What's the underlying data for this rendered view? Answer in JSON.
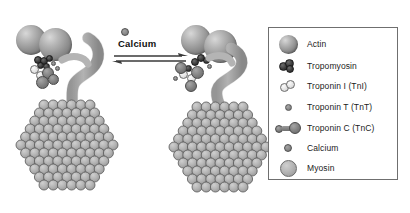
{
  "figure": {
    "reaction_label": "Calcium",
    "arrow_type": "equilibrium-double-arrow"
  },
  "legend": {
    "border_color": "#6f6f6f",
    "background_color": "#ffffff",
    "items": [
      {
        "icon": "actin-sphere-icon",
        "label": "Actin",
        "color": "#8d8d8d",
        "size": "large"
      },
      {
        "icon": "tropomyosin-icon",
        "label": "Tropomyosin",
        "color": "#2b2b2b",
        "size": "small"
      },
      {
        "icon": "troponin-i-icon",
        "label": "Troponin I (TnI)",
        "color": "#e3e3e3",
        "size": "small"
      },
      {
        "icon": "troponin-t-icon",
        "label": "Troponin T (TnT)",
        "color": "#8a8a8a",
        "size": "tiny"
      },
      {
        "icon": "troponin-c-icon",
        "label": "Troponin C (TnC)",
        "color": "#7f7f7f",
        "size": "dumbbell"
      },
      {
        "icon": "calcium-ion-icon",
        "label": "Calcium",
        "color": "#8a8a8a",
        "size": "tiny"
      },
      {
        "icon": "myosin-sphere-icon",
        "label": "Myosin",
        "color": "#b9b9b9",
        "size": "medium"
      }
    ]
  },
  "panels": {
    "left": {
      "name": "relaxed-state-panel",
      "description": "Actin filament with tropomyosin and troponin complex, calcium absent",
      "actin_count": 2,
      "myosin_filament": "myosin-filament-cross-section"
    },
    "right": {
      "name": "activated-state-panel",
      "description": "Actin filament with tropomyosin shifted after calcium binding",
      "actin_count": 2,
      "myosin_filament": "myosin-filament-cross-section"
    }
  },
  "chart_data": {
    "type": "diagram",
    "components": [
      "Actin",
      "Tropomyosin",
      "Troponin I (TnI)",
      "Troponin T (TnT)",
      "Troponin C (TnC)",
      "Calcium",
      "Myosin"
    ]
  }
}
